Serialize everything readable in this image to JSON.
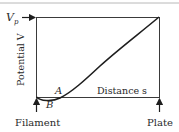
{
  "diagram": {
    "labels": {
      "vp_main": "V",
      "vp_sub": "p",
      "y_axis": "Potential V",
      "x_axis": "Distance s",
      "point_a": "A",
      "point_b": "B",
      "filament": "Filament",
      "plate": "Plate"
    },
    "colors": {
      "line": "#1e1e1e",
      "frame": "#3a3a3a",
      "top_rule": "#b8b8b8",
      "text": "#2a2a2a"
    }
  }
}
